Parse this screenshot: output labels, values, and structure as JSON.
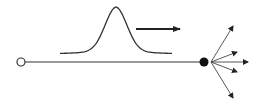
{
  "diagram": {
    "colors": {
      "background": "#ffffff",
      "stroke": "#333333",
      "fill": "#111111"
    },
    "source": {
      "x": 21,
      "y": 62,
      "r": 4
    },
    "line": {
      "x1": 25,
      "y1": 62,
      "x2": 200,
      "y2": 62
    },
    "target": {
      "x": 204,
      "y": 62,
      "r": 4.5
    },
    "packet": {
      "x0": 60,
      "x1": 172,
      "baseline": 54,
      "peak_x": 116,
      "peak_y": 7
    },
    "direction_arrow": {
      "x1": 136,
      "y1": 29,
      "x2": 180,
      "y2": 29
    },
    "fan": {
      "origin": {
        "x": 211,
        "y": 62
      },
      "ends": [
        {
          "x": 233,
          "y": 26
        },
        {
          "x": 237,
          "y": 52
        },
        {
          "x": 248,
          "y": 62
        },
        {
          "x": 237,
          "y": 72
        },
        {
          "x": 233,
          "y": 98
        }
      ]
    }
  }
}
